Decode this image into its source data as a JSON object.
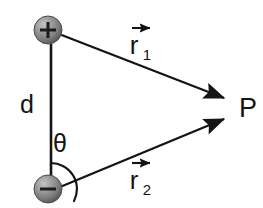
{
  "figure": {
    "kind": "electric-dipole-diagram",
    "background_color": "#ffffff",
    "stroke_color": "#151515",
    "width": 263,
    "height": 208
  },
  "charges": {
    "positive": {
      "symbol": "+",
      "name": "positive-charge",
      "cx": 48,
      "cy": 30,
      "r": 14,
      "fill_light": "#b3b3b3",
      "fill_mid": "#8c8c8c",
      "fill_dark": "#5e5e5e",
      "edge": "#4a4a4a"
    },
    "negative": {
      "symbol": "−",
      "name": "negative-charge",
      "cx": 48,
      "cy": 189,
      "r": 14,
      "fill_light": "#b3b3b3",
      "fill_mid": "#8c8c8c",
      "fill_dark": "#5e5e5e",
      "edge": "#4a4a4a"
    }
  },
  "separation": {
    "label": "d",
    "label_x": 27,
    "label_y": 113,
    "line_x": 51,
    "line_y1": 44,
    "line_y2": 176
  },
  "angle": {
    "label": "θ",
    "label_x": 58,
    "label_y": 152,
    "arc_radius": 26,
    "vertex_x": 51,
    "vertex_y": 189
  },
  "vectors": [
    {
      "name": "r1",
      "letter": "r",
      "subscript": "1",
      "from_x": 59,
      "from_y": 34,
      "to_x": 229,
      "to_y": 100,
      "label_x": 134,
      "label_y": 54,
      "arrow_x1": 132,
      "arrow_x2": 153,
      "arrow_y": 28
    },
    {
      "name": "r2",
      "letter": "r",
      "subscript": "2",
      "from_x": 60,
      "from_y": 187,
      "to_x": 229,
      "to_y": 117,
      "label_x": 134,
      "label_y": 189,
      "arrow_x1": 132,
      "arrow_x2": 153,
      "arrow_y": 163
    }
  ],
  "point": {
    "label": "P",
    "label_x": 239,
    "label_y": 116
  }
}
